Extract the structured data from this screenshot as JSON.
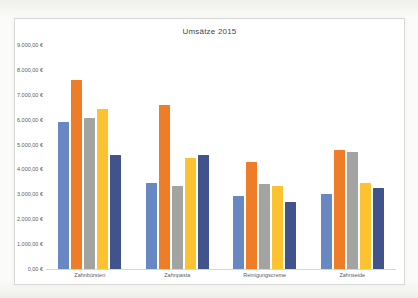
{
  "page": {
    "background": "#f6f6f3"
  },
  "chart_data": {
    "type": "bar",
    "title": "Umsätze 2015",
    "categories": [
      "Zahnbürsten",
      "Zahnpasta",
      "Reinigungscreme",
      "Zahnseide"
    ],
    "series": [
      {
        "name": "blue",
        "color": "#6788c2",
        "values": [
          5900,
          3450,
          2950,
          3000
        ]
      },
      {
        "name": "orange",
        "color": "#ef7d28",
        "values": [
          7600,
          6600,
          4300,
          4800
        ]
      },
      {
        "name": "gray",
        "color": "#a3a3a1",
        "values": [
          6050,
          3350,
          3400,
          4700
        ]
      },
      {
        "name": "yellow",
        "color": "#fcc230",
        "values": [
          6450,
          4450,
          3350,
          3450
        ]
      },
      {
        "name": "dark-blue",
        "color": "#40538a",
        "values": [
          4600,
          4600,
          2700,
          3250
        ]
      }
    ],
    "xlabel": "",
    "ylabel": "",
    "ylim": [
      0,
      9000
    ],
    "y_tick_step": 1000,
    "y_tick_labels": [
      "9.000,00 €",
      "8.000,00 €",
      "7.000,00 €",
      "6.000,00 €",
      "5.000,00 €",
      "4.000,00 €",
      "3.000,00 €",
      "2.000,00 €",
      "1.000,00 €",
      "0,00 €"
    ],
    "grid": false,
    "legend_position": "none"
  }
}
